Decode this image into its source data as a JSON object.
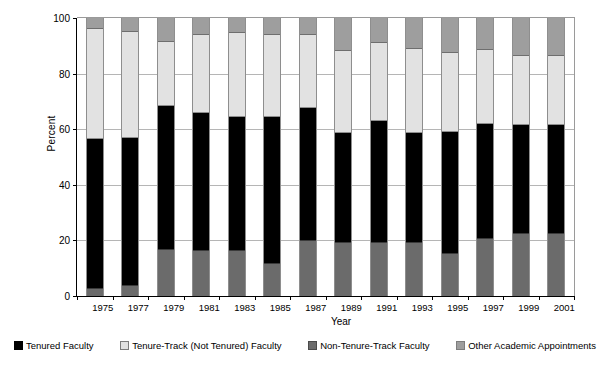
{
  "chart_data": {
    "type": "bar",
    "stacked": true,
    "title": "",
    "xlabel": "Year",
    "ylabel": "Percent",
    "ylim": [
      0,
      100
    ],
    "yticks": [
      0,
      20,
      40,
      60,
      80,
      100
    ],
    "grid": true,
    "legend_position": "bottom",
    "categories": [
      "1975",
      "1977",
      "1979",
      "1981",
      "1983",
      "1985",
      "1987",
      "1989",
      "1991",
      "1993",
      "1995",
      "1997",
      "1999",
      "2001"
    ],
    "series": [
      {
        "name": "Tenured Faculty",
        "color": "#000000",
        "values": [
          53.5,
          53,
          51.5,
          49.5,
          48,
          52.5,
          47.5,
          39,
          43.5,
          39,
          43.5,
          41,
          39,
          39
        ]
      },
      {
        "name": "Tenure-Track (Not Tenured) Faculty",
        "color": "#e2e2e2",
        "values": [
          39.5,
          38,
          23,
          28,
          30,
          29.5,
          26.5,
          29.5,
          28,
          30.5,
          28.5,
          26.5,
          25,
          25
        ]
      },
      {
        "name": "Non-Tenure-Track Faculty",
        "color": "#6b6b6b",
        "values": [
          3,
          4,
          17,
          16.5,
          16.5,
          12,
          20,
          19.5,
          19.5,
          19.5,
          15.5,
          21,
          22.5,
          22.5
        ]
      },
      {
        "name": "Other Academic Appointments",
        "color": "#9e9e9e",
        "values": [
          4,
          5,
          8.5,
          6,
          5.5,
          6,
          6,
          12,
          9,
          11,
          12.5,
          11.5,
          13.5,
          13.5
        ]
      }
    ],
    "stack_order_bottom_to_top": [
      "Non-Tenure-Track Faculty",
      "Tenured Faculty",
      "Tenure-Track (Not Tenured) Faculty",
      "Other Academic Appointments"
    ]
  },
  "axes": {
    "ylabel": "Percent",
    "xlabel": "Year",
    "ytick_labels": [
      "0",
      "20",
      "40",
      "60",
      "80",
      "100"
    ],
    "xtick_labels": [
      "1975",
      "1977",
      "1979",
      "1981",
      "1983",
      "1985",
      "1987",
      "1989",
      "1991",
      "1993",
      "1995",
      "1997",
      "1999",
      "2001"
    ]
  },
  "legend": {
    "items": [
      {
        "label": "Tenured Faculty",
        "swatch": "tenured"
      },
      {
        "label": "Tenure-Track (Not Tenured) Faculty",
        "swatch": "tt"
      },
      {
        "label": "Non-Tenure-Track Faculty",
        "swatch": "ntt"
      },
      {
        "label": "Other Academic Appointments",
        "swatch": "other"
      }
    ]
  },
  "colors": {
    "tenured": "#000000",
    "tenure_track": "#e2e2e2",
    "non_tenure_track": "#6b6b6b",
    "other_academic": "#9e9e9e",
    "gridline": "#b5b5b5",
    "axis": "#000000"
  }
}
